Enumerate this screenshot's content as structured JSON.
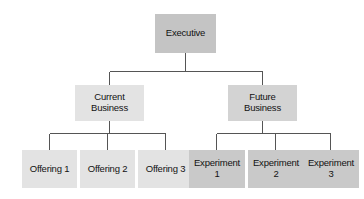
{
  "diagram": {
    "type": "organization-chart",
    "background_color": "#ffffff",
    "connector_color": "#555555",
    "tiers": [
      {
        "level": 1,
        "nodes": [
          {
            "id": "executive",
            "label": "Executive",
            "fill": "#c4c4c4"
          }
        ]
      },
      {
        "level": 2,
        "nodes": [
          {
            "id": "current-business",
            "label": "Current\nBusiness",
            "fill": "#e3e3e3"
          },
          {
            "id": "future-business",
            "label": "Future\nBusiness",
            "fill": "#d3d3d3"
          }
        ]
      },
      {
        "level": 3,
        "nodes": [
          {
            "id": "offering-1",
            "label": "Offering 1",
            "fill": "#e3e3e3"
          },
          {
            "id": "offering-2",
            "label": "Offering 2",
            "fill": "#e3e3e3"
          },
          {
            "id": "offering-3",
            "label": "Offering 3",
            "fill": "#e3e3e3"
          },
          {
            "id": "experiment-1",
            "label": "Experiment\n1",
            "fill": "#c9c9c9"
          },
          {
            "id": "experiment-2",
            "label": "Experiment\n2",
            "fill": "#c9c9c9"
          },
          {
            "id": "experiment-3",
            "label": "Experiment\n3",
            "fill": "#c9c9c9"
          }
        ]
      }
    ],
    "edges": [
      {
        "from": "executive",
        "to": "current-business"
      },
      {
        "from": "executive",
        "to": "future-business"
      },
      {
        "from": "current-business",
        "to": "offering-1"
      },
      {
        "from": "current-business",
        "to": "offering-2"
      },
      {
        "from": "current-business",
        "to": "offering-3"
      },
      {
        "from": "future-business",
        "to": "experiment-1"
      },
      {
        "from": "future-business",
        "to": "experiment-2"
      },
      {
        "from": "future-business",
        "to": "experiment-3"
      }
    ]
  }
}
